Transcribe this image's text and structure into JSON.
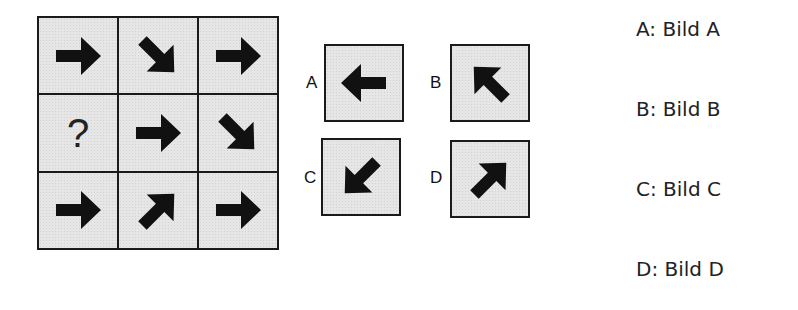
{
  "puzzle": {
    "grid": [
      [
        {
          "type": "arrow",
          "direction": "right",
          "icon": "arrow-right-icon"
        },
        {
          "type": "arrow",
          "direction": "down-right",
          "icon": "arrow-down-right-icon"
        },
        {
          "type": "arrow",
          "direction": "right",
          "icon": "arrow-right-icon"
        }
      ],
      [
        {
          "type": "missing",
          "text": "?"
        },
        {
          "type": "arrow",
          "direction": "right",
          "icon": "arrow-right-icon"
        },
        {
          "type": "arrow",
          "direction": "down-right",
          "icon": "arrow-down-right-icon"
        }
      ],
      [
        {
          "type": "arrow",
          "direction": "right",
          "icon": "arrow-right-icon"
        },
        {
          "type": "arrow",
          "direction": "up-right",
          "icon": "arrow-up-right-icon"
        },
        {
          "type": "arrow",
          "direction": "right",
          "icon": "arrow-right-icon"
        }
      ]
    ],
    "missing_text": "?",
    "options": [
      {
        "letter": "A",
        "direction": "left",
        "icon": "arrow-left-icon"
      },
      {
        "letter": "B",
        "direction": "up-left",
        "icon": "arrow-up-left-icon"
      },
      {
        "letter": "C",
        "direction": "down-left",
        "icon": "arrow-down-left-icon"
      },
      {
        "letter": "D",
        "direction": "up-right",
        "icon": "arrow-up-right-icon"
      }
    ]
  },
  "answers": [
    {
      "label": "A: Bild A"
    },
    {
      "label": "B: Bild B"
    },
    {
      "label": "C: Bild C"
    },
    {
      "label": "D: Bild D"
    }
  ],
  "colors": {
    "cell_fill": "#e6e6e6",
    "border": "#1a1a1a",
    "arrow": "#111111",
    "text": "#222222"
  }
}
